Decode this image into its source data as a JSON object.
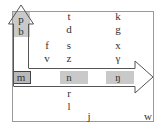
{
  "diagram": {
    "type": "consonant-place-manner-chart",
    "colors": {
      "frame": "#9a9a9a",
      "shade": "#c9c9c9",
      "arrow": "#555555",
      "text": "#333333"
    },
    "cells": [
      {
        "id": "p",
        "text": "p",
        "x": 21,
        "y": 19
      },
      {
        "id": "b",
        "text": "b",
        "x": 21,
        "y": 31
      },
      {
        "id": "t",
        "text": "t",
        "x": 69,
        "y": 16
      },
      {
        "id": "d",
        "text": "d",
        "x": 69,
        "y": 29
      },
      {
        "id": "k",
        "text": "k",
        "x": 118,
        "y": 16
      },
      {
        "id": "g",
        "text": "g",
        "x": 118,
        "y": 29
      },
      {
        "id": "f",
        "text": "f",
        "x": 47,
        "y": 45
      },
      {
        "id": "s",
        "text": "s",
        "x": 69,
        "y": 45
      },
      {
        "id": "x",
        "text": "x",
        "x": 118,
        "y": 45
      },
      {
        "id": "v",
        "text": "v",
        "x": 47,
        "y": 58
      },
      {
        "id": "z",
        "text": "z",
        "x": 69,
        "y": 58
      },
      {
        "id": "gamma",
        "text": "γ",
        "x": 118,
        "y": 58
      },
      {
        "id": "m",
        "text": "m",
        "x": 21,
        "y": 77
      },
      {
        "id": "n",
        "text": "n",
        "x": 69,
        "y": 77
      },
      {
        "id": "eng",
        "text": "ŋ",
        "x": 118,
        "y": 77
      },
      {
        "id": "r",
        "text": "r",
        "x": 69,
        "y": 93
      },
      {
        "id": "l",
        "text": "l",
        "x": 69,
        "y": 106
      },
      {
        "id": "j",
        "text": "j",
        "x": 89,
        "y": 116
      },
      {
        "id": "w",
        "text": "w",
        "x": 148,
        "y": 116
      }
    ],
    "arrows": [
      {
        "name": "vertical-arrow-up",
        "direction": "up",
        "from": "m",
        "to": "p"
      },
      {
        "name": "horizontal-arrow-right",
        "direction": "right",
        "from": "m",
        "to": "eng"
      }
    ]
  }
}
